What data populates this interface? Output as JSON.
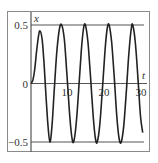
{
  "chart_data": {
    "type": "line",
    "title": "",
    "xlabel": "t",
    "ylabel": "x",
    "xlim": [
      0,
      30
    ],
    "ylim": [
      -0.5,
      0.5
    ],
    "x_ticks": [
      {
        "value": 10,
        "label": "10"
      },
      {
        "value": 20,
        "label": "20"
      },
      {
        "value": 30,
        "label": "30"
      }
    ],
    "y_ticks": [
      {
        "value": 0.5,
        "label": "0.5"
      },
      {
        "value": 0,
        "label": "0"
      },
      {
        "value": -0.5,
        "label": "−0.5"
      }
    ],
    "reference_lines": [
      {
        "y": 0.5,
        "label": "upper bound"
      },
      {
        "y": -0.5,
        "label": "lower bound"
      }
    ],
    "grid": false,
    "legend": null,
    "series": [
      {
        "name": "x(t)",
        "description": "oscillation starting at origin, first peak ~0.45 at t~2.4, then steady amplitude 0.5 with period ~6.3",
        "points": [
          [
            0,
            0
          ],
          [
            0.5,
            0.03
          ],
          [
            1.0,
            0.12
          ],
          [
            1.5,
            0.27
          ],
          [
            2.0,
            0.4
          ],
          [
            2.4,
            0.45
          ],
          [
            3.0,
            0.38
          ],
          [
            3.5,
            0.18
          ],
          [
            4.0,
            -0.08
          ],
          [
            4.5,
            -0.32
          ],
          [
            5.1,
            -0.5
          ],
          [
            5.7,
            -0.35
          ],
          [
            6.3,
            -0.05
          ],
          [
            7.0,
            0.28
          ],
          [
            7.7,
            0.47
          ],
          [
            8.3,
            0.5
          ],
          [
            9.0,
            0.38
          ],
          [
            9.7,
            0.08
          ],
          [
            10.4,
            -0.25
          ],
          [
            11.0,
            -0.45
          ],
          [
            11.5,
            -0.5
          ],
          [
            12.2,
            -0.35
          ],
          [
            12.9,
            -0.05
          ],
          [
            13.6,
            0.28
          ],
          [
            14.2,
            0.47
          ],
          [
            14.7,
            0.5
          ],
          [
            15.4,
            0.35
          ],
          [
            16.1,
            0.05
          ],
          [
            16.8,
            -0.28
          ],
          [
            17.4,
            -0.47
          ],
          [
            17.9,
            -0.5
          ],
          [
            18.6,
            -0.35
          ],
          [
            19.3,
            -0.05
          ],
          [
            20.0,
            0.28
          ],
          [
            20.6,
            0.47
          ],
          [
            21.1,
            0.5
          ],
          [
            21.8,
            0.35
          ],
          [
            22.5,
            0.05
          ],
          [
            23.2,
            -0.28
          ],
          [
            23.8,
            -0.47
          ],
          [
            24.4,
            -0.5
          ],
          [
            25.1,
            -0.35
          ],
          [
            25.8,
            -0.05
          ],
          [
            26.5,
            0.28
          ],
          [
            27.1,
            0.47
          ],
          [
            27.5,
            0.5
          ],
          [
            28.2,
            0.35
          ],
          [
            28.9,
            0.05
          ],
          [
            29.6,
            -0.28
          ],
          [
            30.2,
            -0.42
          ]
        ]
      }
    ]
  },
  "colors": {
    "curve": "#222222",
    "axis": "#555555",
    "frame": "#8a8a8a"
  }
}
